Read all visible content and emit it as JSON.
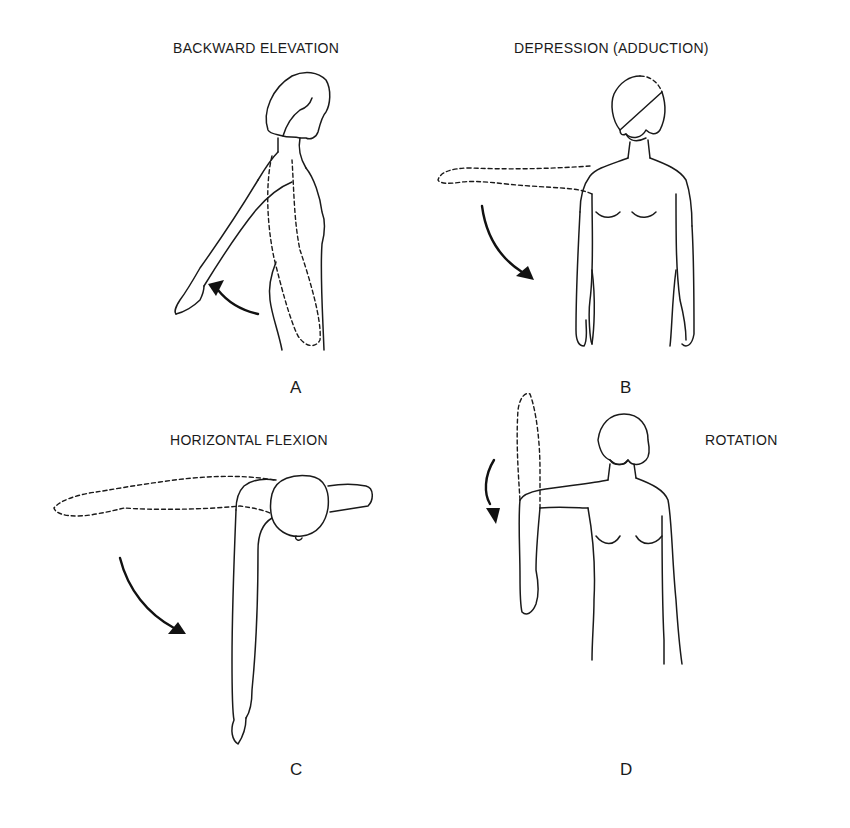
{
  "panels": [
    {
      "id": "A",
      "title": "BACKWARD ELEVATION",
      "letter": "A"
    },
    {
      "id": "B",
      "title": "DEPRESSION (ADDUCTION)",
      "letter": "B"
    },
    {
      "id": "C",
      "title": "HORIZONTAL FLEXION",
      "letter": "C"
    },
    {
      "id": "D",
      "title": "ROTATION",
      "letter": "D"
    }
  ],
  "colors": {
    "ink": "#1a1a1a",
    "background": "#ffffff"
  }
}
